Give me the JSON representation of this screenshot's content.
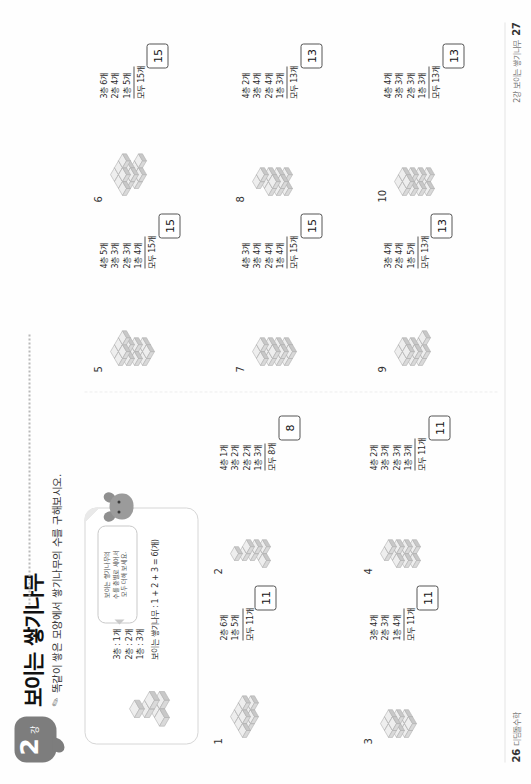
{
  "header": {
    "unit_number": "2",
    "unit_suffix": "강",
    "title": "보이는 쌓기나무",
    "subtitle": "똑같이 쌓은 모양에서 쌓기나무의 수를 구해보시오.",
    "pencil_icon": "pencil-icon"
  },
  "example": {
    "speech_lines": [
      "보이는 쌓기나무의",
      "수를 층별로 세어서",
      "모두 더해 보세요."
    ],
    "mascot_icon": "mascot-icon",
    "lines": [
      "3층 : 1개",
      "2층 : 2개",
      "1층 : 3개"
    ],
    "sum_text": "보이는 쌓기나무 : 1 + 2 + 3 = 6(개)",
    "shape_cubes": 6
  },
  "problems": [
    {
      "num": "1",
      "layers": [
        "2층  6개",
        "1층  5개"
      ],
      "total": "모두 11개",
      "answer": "11"
    },
    {
      "num": "2",
      "layers": [
        "4층  1개",
        "3층  2개",
        "2층  2개",
        "1층  3개"
      ],
      "total": "모두  8개",
      "answer": "8"
    },
    {
      "num": "3",
      "layers": [
        "3층  4개",
        "2층  3개",
        "1층  4개"
      ],
      "total": "모두 11개",
      "answer": "11"
    },
    {
      "num": "4",
      "layers": [
        "4층  2개",
        "3층  3개",
        "2층  3개",
        "1층  3개"
      ],
      "total": "모두 11개",
      "answer": "11"
    },
    {
      "num": "5",
      "layers": [
        "4층  5개",
        "3층  3개",
        "2층  3개",
        "1층  4개"
      ],
      "total": "모두 15개",
      "answer": "15"
    },
    {
      "num": "6",
      "layers": [
        "3층  6개",
        "2층  4개",
        "1층  5개"
      ],
      "total": "모두 15개",
      "answer": "15"
    },
    {
      "num": "7",
      "layers": [
        "4층  3개",
        "3층  4개",
        "2층  4개",
        "1층  4개"
      ],
      "total": "모두 15개",
      "answer": "15"
    },
    {
      "num": "8",
      "layers": [
        "4층  2개",
        "3층  4개",
        "2층  4개",
        "1층  3개"
      ],
      "total": "모두 13개",
      "answer": "13"
    },
    {
      "num": "9",
      "layers": [
        "3층  4개",
        "2층  4개",
        "1층  5개"
      ],
      "total": "모두 13개",
      "answer": "13"
    },
    {
      "num": "10",
      "layers": [
        "4층  4개",
        "3층  3개",
        "2층  3개",
        "1층  3개"
      ],
      "total": "모두 13개",
      "answer": "13"
    }
  ],
  "footer": {
    "left_page": "26",
    "left_text": "디딤돌수학",
    "right_text": "2강 보이는 쌓기나무",
    "right_page": "27"
  },
  "colors": {
    "cube_top": "#eeeeee",
    "cube_left": "#d9d9d9",
    "cube_right": "#c8c8c8",
    "cube_edge": "#b0b0b0",
    "badge": "#7d7d7d",
    "rule": "#555555"
  }
}
